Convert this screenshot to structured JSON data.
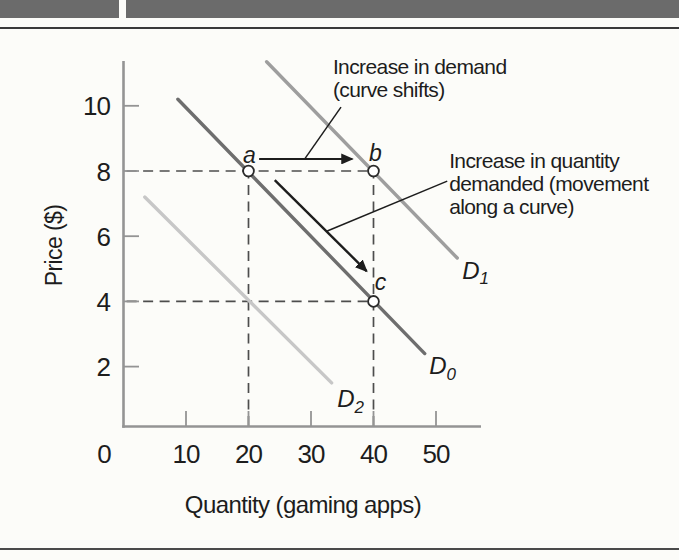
{
  "figure": {
    "background": "#fcfcf9",
    "header_bar_color": "#6b6b6b",
    "top_rule_color": "#3a3a3a",
    "bottom_rule_color": "#4a4a4a"
  },
  "chart_data": {
    "type": "line",
    "title": "",
    "xlabel": "Quantity (gaming apps)",
    "ylabel": "Price ($)",
    "origin_label": "0",
    "x_ticks": [
      10,
      20,
      30,
      40,
      50
    ],
    "y_ticks": [
      2,
      4,
      6,
      8,
      10
    ],
    "xlim": [
      0,
      57
    ],
    "ylim": [
      0,
      11.5
    ],
    "grid": false,
    "legend": "none",
    "axis_color": "#949494",
    "text_color": "#1d1d1d",
    "dash_color": "#4d4d4d",
    "arrow_color": "#1d1d1d",
    "series": [
      {
        "id": "D0",
        "label_base": "D",
        "label_sub": "0",
        "color": "#6e6e6e",
        "points": [
          [
            8.7,
            10.2
          ],
          [
            48.2,
            2.4
          ]
        ],
        "label_at": [
          48.9,
          1.77
        ]
      },
      {
        "id": "D1",
        "label_base": "D",
        "label_sub": "1",
        "color": "#9e9e9e",
        "points": [
          [
            22.9,
            11.35
          ],
          [
            53.4,
            5.33
          ]
        ],
        "label_at": [
          54.2,
          4.69
        ]
      },
      {
        "id": "D2",
        "label_base": "D",
        "label_sub": "2",
        "color": "#c7c7c7",
        "points": [
          [
            3.4,
            7.2
          ],
          [
            33.3,
            1.5
          ]
        ],
        "label_at": [
          34.2,
          0.76
        ]
      }
    ],
    "markers": [
      {
        "label": "a",
        "q": 20,
        "p": 8
      },
      {
        "label": "b",
        "q": 40,
        "p": 8
      },
      {
        "label": "c",
        "q": 40,
        "p": 4
      }
    ],
    "dashed_guides": [
      {
        "orient": "h",
        "p": 8,
        "q0": 0.5,
        "q1": 40
      },
      {
        "orient": "h",
        "p": 4,
        "q0": 0.5,
        "q1": 40
      },
      {
        "orient": "v",
        "q": 20,
        "p0": 0.18,
        "p1": 8
      },
      {
        "orient": "v",
        "q": 40,
        "p0": 0.18,
        "p1": 8
      }
    ],
    "arrows": [
      {
        "id": "demand-shift-arrow",
        "from": [
          21.7,
          8.37
        ],
        "to": [
          36.6,
          8.37
        ],
        "head": true,
        "width": 1.9
      },
      {
        "id": "movement-arrow",
        "from": [
          24.2,
          7.72
        ],
        "to": [
          38.9,
          4.93
        ],
        "head": true,
        "width": 2.4
      },
      {
        "id": "demand-shift-leader",
        "from": [
          34.8,
          9.96
        ],
        "to": [
          29.0,
          8.37
        ],
        "head": false,
        "width": 1.5
      },
      {
        "id": "movement-leader",
        "from": [
          51.8,
          7.69
        ],
        "to": [
          32.6,
          6.16
        ],
        "head": false,
        "width": 1.5
      }
    ],
    "annotations": [
      {
        "id": "demand-shift-note",
        "anchor": [
          33.5,
          10.97
        ],
        "lines": [
          "Increase in demand",
          "(curve shifts)"
        ]
      },
      {
        "id": "movement-note",
        "anchor": [
          52.1,
          8.08
        ],
        "lines": [
          "Increase in quantity",
          "demanded (movement",
          "along a curve)"
        ]
      }
    ]
  }
}
